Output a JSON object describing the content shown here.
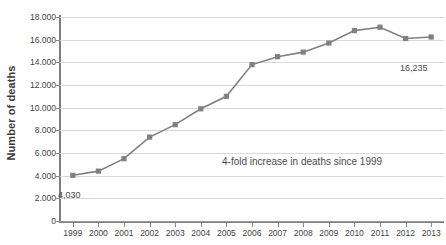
{
  "chart_data": {
    "type": "line",
    "title": "",
    "xlabel": "",
    "ylabel": "Number of deaths",
    "categories": [
      "1999",
      "2000",
      "2001",
      "2002",
      "2003",
      "2004",
      "2005",
      "2006",
      "2007",
      "2008",
      "2009",
      "2010",
      "2011",
      "2012",
      "2013"
    ],
    "values": [
      4030,
      4400,
      5500,
      7400,
      8500,
      9900,
      11000,
      13800,
      14500,
      14900,
      15700,
      16800,
      17100,
      16100,
      16235
    ],
    "series": [
      {
        "name": "Number of deaths",
        "values": [
          4030,
          4400,
          5500,
          7400,
          8500,
          9900,
          11000,
          13800,
          14500,
          14900,
          15700,
          16800,
          17100,
          16100,
          16235
        ]
      }
    ],
    "ylim": [
      0,
      18000
    ],
    "ytick_values": [
      0,
      2000,
      4000,
      6000,
      8000,
      10000,
      12000,
      14000,
      16000,
      18000
    ],
    "ytick_labels": [
      "0",
      "2.000",
      "4.000",
      "6.000",
      "8.000",
      "10.000",
      "12.000",
      "14.000",
      "16.000",
      "18.000"
    ],
    "grid": true,
    "legend": "none",
    "marker": "square",
    "series_color": "#808080",
    "grid_color": "#d8d8d8",
    "axis_color": "#7d7d7d",
    "text_color": "#3f3f3f",
    "annotations": [
      {
        "id": "first-point",
        "text": "4,030",
        "x": "1999",
        "y": 4030
      },
      {
        "id": "last-point",
        "text": "16,235",
        "x": "2013",
        "y": 16235
      },
      {
        "id": "summary",
        "text": "4-fold increase in deaths since 1999"
      }
    ]
  }
}
